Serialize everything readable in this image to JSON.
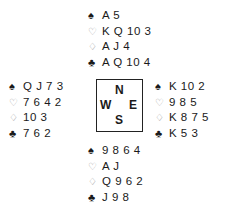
{
  "suits": {
    "spades": {
      "symbol": "♠",
      "style": "black"
    },
    "hearts": {
      "symbol": "♡",
      "style": "outline"
    },
    "diamonds": {
      "symbol": "♢",
      "style": "outline"
    },
    "clubs": {
      "symbol": "♣",
      "style": "black"
    }
  },
  "compass": {
    "north": "N",
    "south": "S",
    "east": "E",
    "west": "W"
  },
  "hands": {
    "north": {
      "spades": "A 5",
      "hearts": "K Q 10 3",
      "diamonds": "A J 4",
      "clubs": "A Q 10 4"
    },
    "west": {
      "spades": "Q J 7 3",
      "hearts": "7 6 4 2",
      "diamonds": "10 3",
      "clubs": "7 6 2"
    },
    "east": {
      "spades": "K 10 2",
      "hearts": "9 8 5",
      "diamonds": "K 8 7 5",
      "clubs": "K 5 3"
    },
    "south": {
      "spades": "9 8 6 4",
      "hearts": "A J",
      "diamonds": "Q 9 6 2",
      "clubs": "J 9 8"
    }
  }
}
